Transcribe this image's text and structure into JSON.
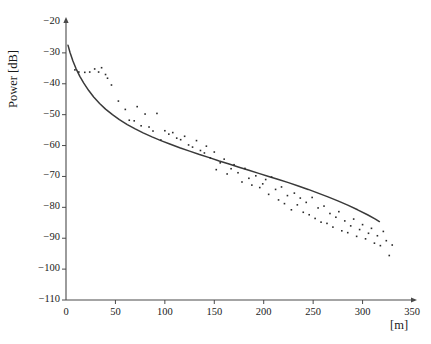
{
  "chart_data": {
    "type": "scatter",
    "title": "",
    "xlabel": "[m]",
    "ylabel": "Power [dB]",
    "xlim": [
      0,
      350
    ],
    "ylim": [
      -110,
      -20
    ],
    "xticks": [
      0,
      50,
      100,
      150,
      200,
      250,
      300,
      350
    ],
    "yticks": [
      -20,
      -30,
      -40,
      -50,
      -60,
      -70,
      -80,
      -90,
      -100,
      -110
    ],
    "xtick_labels": [
      "0",
      "50",
      "100",
      "150",
      "200",
      "250",
      "300",
      "350"
    ],
    "ytick_labels": [
      "−20",
      "−30",
      "−40",
      "−50",
      "−60",
      "−70",
      "−80",
      "−90",
      "−100",
      "−110"
    ],
    "grid": false,
    "legend": null,
    "axis_style": "arrow-ended-open-axes",
    "colors": {
      "axis": "#4a4a4a",
      "fit_line": "#3a3a3a",
      "points": "#2a2a2a",
      "text": "#1a1a1a",
      "background": "#ffffff"
    },
    "series": [
      {
        "name": "measured-power-samples",
        "type": "scatter",
        "marker": "square",
        "marker_size": 1.6,
        "points": [
          [
            9,
            -35.5
          ],
          [
            13,
            -36.2
          ],
          [
            19,
            -36.3
          ],
          [
            24,
            -36.2
          ],
          [
            29,
            -35.2
          ],
          [
            33,
            -36.2
          ],
          [
            36,
            -34.8
          ],
          [
            40,
            -37.0
          ],
          [
            42,
            -38.2
          ],
          [
            46,
            -40.4
          ],
          [
            53,
            -45.6
          ],
          [
            60,
            -48.3
          ],
          [
            64,
            -51.8
          ],
          [
            69,
            -52.0
          ],
          [
            72,
            -47.4
          ],
          [
            76,
            -53.6
          ],
          [
            80,
            -49.8
          ],
          [
            84,
            -54.0
          ],
          [
            88,
            -55.3
          ],
          [
            92,
            -49.6
          ],
          [
            96,
            -58.2
          ],
          [
            100,
            -55.2
          ],
          [
            104,
            -56.3
          ],
          [
            108,
            -55.8
          ],
          [
            112,
            -57.6
          ],
          [
            116,
            -58.1
          ],
          [
            120,
            -57.0
          ],
          [
            124,
            -59.8
          ],
          [
            128,
            -60.5
          ],
          [
            132,
            -58.4
          ],
          [
            136,
            -61.6
          ],
          [
            140,
            -62.4
          ],
          [
            142,
            -60.2
          ],
          [
            146,
            -64.0
          ],
          [
            150,
            -62.1
          ],
          [
            152,
            -67.8
          ],
          [
            156,
            -65.6
          ],
          [
            160,
            -64.4
          ],
          [
            163,
            -69.2
          ],
          [
            167,
            -67.5
          ],
          [
            170,
            -66.2
          ],
          [
            174,
            -68.8
          ],
          [
            178,
            -71.8
          ],
          [
            181,
            -67.4
          ],
          [
            185,
            -70.6
          ],
          [
            188,
            -72.8
          ],
          [
            192,
            -69.8
          ],
          [
            196,
            -73.6
          ],
          [
            199,
            -72.4
          ],
          [
            202,
            -71.0
          ],
          [
            205,
            -75.8
          ],
          [
            208,
            -70.2
          ],
          [
            212,
            -74.2
          ],
          [
            215,
            -77.6
          ],
          [
            218,
            -73.4
          ],
          [
            221,
            -78.8
          ],
          [
            224,
            -76.2
          ],
          [
            228,
            -80.8
          ],
          [
            231,
            -75.4
          ],
          [
            234,
            -79.2
          ],
          [
            237,
            -77.0
          ],
          [
            240,
            -81.6
          ],
          [
            243,
            -78.4
          ],
          [
            246,
            -82.4
          ],
          [
            249,
            -76.8
          ],
          [
            252,
            -83.6
          ],
          [
            255,
            -80.2
          ],
          [
            258,
            -84.8
          ],
          [
            261,
            -79.6
          ],
          [
            264,
            -85.2
          ],
          [
            267,
            -82.0
          ],
          [
            270,
            -86.4
          ],
          [
            273,
            -83.2
          ],
          [
            276,
            -81.4
          ],
          [
            279,
            -87.6
          ],
          [
            282,
            -84.4
          ],
          [
            285,
            -88.2
          ],
          [
            288,
            -86.0
          ],
          [
            291,
            -83.8
          ],
          [
            294,
            -89.4
          ],
          [
            297,
            -87.2
          ],
          [
            300,
            -85.6
          ],
          [
            303,
            -90.2
          ],
          [
            306,
            -88.4
          ],
          [
            309,
            -86.8
          ],
          [
            312,
            -91.6
          ],
          [
            315,
            -89.2
          ],
          [
            318,
            -92.4
          ],
          [
            321,
            -87.8
          ],
          [
            324,
            -90.8
          ],
          [
            327,
            -95.6
          ],
          [
            330,
            -92.2
          ]
        ]
      },
      {
        "name": "path-loss-fit-curve",
        "type": "line",
        "points": [
          [
            2,
            -27.5
          ],
          [
            4,
            -29.8
          ],
          [
            7,
            -32.6
          ],
          [
            10,
            -35.0
          ],
          [
            14,
            -37.6
          ],
          [
            18,
            -39.8
          ],
          [
            23,
            -42.2
          ],
          [
            28,
            -44.3
          ],
          [
            34,
            -46.4
          ],
          [
            40,
            -48.2
          ],
          [
            47,
            -50.0
          ],
          [
            54,
            -51.6
          ],
          [
            62,
            -53.2
          ],
          [
            70,
            -54.6
          ],
          [
            78,
            -55.9
          ],
          [
            87,
            -57.2
          ],
          [
            96,
            -58.4
          ],
          [
            105,
            -59.5
          ],
          [
            115,
            -60.7
          ],
          [
            125,
            -61.8
          ],
          [
            135,
            -62.9
          ],
          [
            145,
            -63.9
          ],
          [
            155,
            -65.0
          ],
          [
            165,
            -66.0
          ],
          [
            175,
            -67.0
          ],
          [
            185,
            -68.0
          ],
          [
            195,
            -69.0
          ],
          [
            205,
            -70.0
          ],
          [
            215,
            -71.0
          ],
          [
            225,
            -72.0
          ],
          [
            235,
            -73.1
          ],
          [
            245,
            -74.2
          ],
          [
            255,
            -75.4
          ],
          [
            265,
            -76.6
          ],
          [
            275,
            -77.9
          ],
          [
            285,
            -79.3
          ],
          [
            295,
            -80.8
          ],
          [
            305,
            -82.4
          ],
          [
            313,
            -83.8
          ],
          [
            317,
            -84.6
          ]
        ]
      }
    ]
  }
}
